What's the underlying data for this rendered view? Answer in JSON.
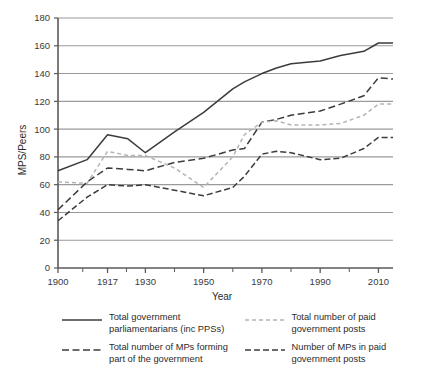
{
  "chart_data": {
    "type": "line",
    "title": "",
    "subtitle": "",
    "xlabel": "Year",
    "ylabel": "MPS/Peers",
    "xlim": [
      1900,
      2015
    ],
    "ylim": [
      0,
      180
    ],
    "yticks": [
      0,
      20,
      40,
      60,
      80,
      100,
      120,
      140,
      160,
      180
    ],
    "xticks": [
      1900,
      1917,
      1930,
      1950,
      1970,
      1990,
      2010
    ],
    "x_tick_labels": [
      "1900",
      "1917",
      "1930",
      "1950",
      "1970",
      "1990",
      "2010"
    ],
    "grid": "horizontal",
    "legend_position": "below",
    "x": [
      1900,
      1910,
      1917,
      1924,
      1930,
      1940,
      1950,
      1960,
      1964,
      1970,
      1975,
      1980,
      1990,
      1997,
      2005,
      2010,
      2015
    ],
    "series": [
      {
        "name": "Total government parliamentarians (inc PPSs)",
        "style": "solid",
        "color": "#3c3c3c",
        "values": [
          70,
          78,
          96,
          93,
          83,
          98,
          112,
          129,
          134,
          140,
          144,
          147,
          149,
          153,
          156,
          162,
          162
        ]
      },
      {
        "name": "Total number of MPs forming part of the government",
        "style": "dashed-long",
        "color": "#3c3c3c",
        "values": [
          42,
          62,
          72,
          71,
          70,
          76,
          79,
          85,
          86,
          105,
          107,
          110,
          113,
          118,
          124,
          137,
          136
        ]
      },
      {
        "name": "Total number of paid government posts",
        "style": "dashed-short",
        "color": "#b4b4b4",
        "values": [
          62,
          61,
          84,
          81,
          81,
          72,
          58,
          80,
          96,
          105,
          106,
          103,
          103,
          104,
          110,
          118,
          118
        ]
      },
      {
        "name": "Number of MPs in paid government posts",
        "style": "dashed-medium",
        "color": "#3c3c3c",
        "values": [
          34,
          51,
          60,
          59,
          60,
          56,
          52,
          58,
          66,
          82,
          84,
          83,
          78,
          79,
          86,
          94,
          94
        ]
      }
    ]
  },
  "axis": {
    "y_label": "MPS/Peers",
    "x_label": "Year",
    "y_ticks": [
      "0",
      "20",
      "40",
      "60",
      "80",
      "100",
      "120",
      "140",
      "160",
      "180"
    ],
    "x_ticks": [
      "1900",
      "1917",
      "1930",
      "1950",
      "1970",
      "1990",
      "2010"
    ]
  },
  "legend": {
    "items": [
      {
        "label_line1": "Total government",
        "label_line2": "parliamentarians (inc PPSs)",
        "style": "solid",
        "color": "#3c3c3c"
      },
      {
        "label_line1": "Total number of paid",
        "label_line2": "government posts",
        "style": "dashed-short",
        "color": "#b4b4b4"
      },
      {
        "label_line1": "Total number of MPs forming",
        "label_line2": "part of the government",
        "style": "dashed-long",
        "color": "#3c3c3c"
      },
      {
        "label_line1": "Number of MPs in paid",
        "label_line2": "government posts",
        "style": "dashed-medium",
        "color": "#3c3c3c"
      }
    ]
  },
  "colors": {
    "gridline": "#9a9a9a",
    "axis": "#5a5a5a",
    "dark_series": "#3c3c3c",
    "light_series": "#b4b4b4",
    "background": "#ffffff"
  }
}
